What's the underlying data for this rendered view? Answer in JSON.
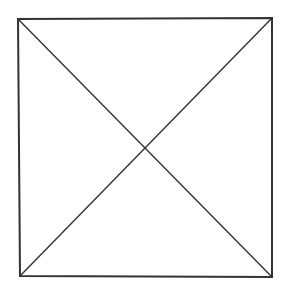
{
  "diagram": {
    "type": "square-with-diagonals",
    "colors": {
      "background": "#ffffff",
      "stroke": "#333333"
    },
    "square": {
      "tl": [
        18,
        19
      ],
      "tr": [
        272,
        18
      ],
      "br": [
        272,
        277
      ],
      "bl": [
        20,
        276
      ]
    },
    "diagonals": [
      {
        "from": "tl",
        "to": "br"
      },
      {
        "from": "tr",
        "to": "bl"
      }
    ],
    "intersection": [
      145,
      148
    ]
  }
}
